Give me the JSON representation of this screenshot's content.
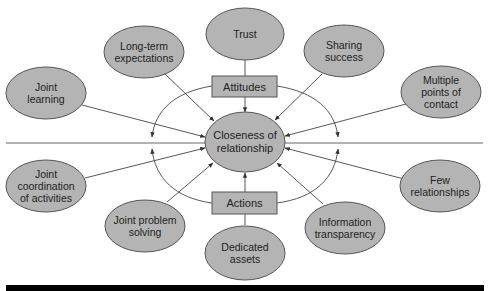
{
  "diagram": {
    "center": {
      "label": "Closeness of\nrelationship"
    },
    "hubs": {
      "attitudes": "Attitudes",
      "actions": "Actions"
    },
    "attitude_factors": [
      {
        "id": "trust",
        "label": "Trust"
      },
      {
        "id": "long-term-expectations",
        "label": "Long-term\nexpectations"
      },
      {
        "id": "sharing-success",
        "label": "Sharing\nsuccess"
      },
      {
        "id": "joint-learning",
        "label": "Joint\nlearning"
      },
      {
        "id": "multiple-points-of-contact",
        "label": "Multiple\npoints of\ncontact"
      }
    ],
    "action_factors": [
      {
        "id": "joint-coordination",
        "label": "Joint\ncoordination\nof activities"
      },
      {
        "id": "joint-problem-solving",
        "label": "Joint problem\nsolving"
      },
      {
        "id": "dedicated-assets",
        "label": "Dedicated\nassets"
      },
      {
        "id": "information-transparency",
        "label": "Information\ntransparency"
      },
      {
        "id": "few-relationships",
        "label": "Few\nrelationships"
      }
    ],
    "colors": {
      "node_fill": "#b4b4b4",
      "node_stroke": "#555555",
      "line": "#444444",
      "bottom_bar": "#000000"
    }
  }
}
